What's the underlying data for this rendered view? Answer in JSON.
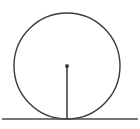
{
  "canvas": {
    "width": 140,
    "height": 129,
    "background_color": "#ffffff"
  },
  "figure": {
    "stroke_color": "#3a3a3a",
    "line_stroke_color": "#4a4a4a",
    "radius_stroke_color": "#444444",
    "center_dot_color": "#222222"
  },
  "shapes": {
    "circle": {
      "name": "circle",
      "center_x": 67,
      "center_y": 66,
      "radius": 53,
      "stroke_width": 1.4,
      "fill": "none"
    },
    "tangent_line": {
      "name": "tangent-line",
      "x1": 2,
      "y1": 119,
      "x2": 138,
      "y2": 119,
      "stroke_width": 1.4
    },
    "radius_segment": {
      "name": "radius-segment",
      "x1": 67,
      "y1": 66,
      "x2": 67,
      "y2": 119,
      "stroke_width": 1.6
    },
    "center_point": {
      "name": "center-point",
      "cx": 67,
      "cy": 66,
      "size": 3.2
    }
  },
  "labels": {
    "center": "",
    "radius": "",
    "tangent_point": ""
  }
}
